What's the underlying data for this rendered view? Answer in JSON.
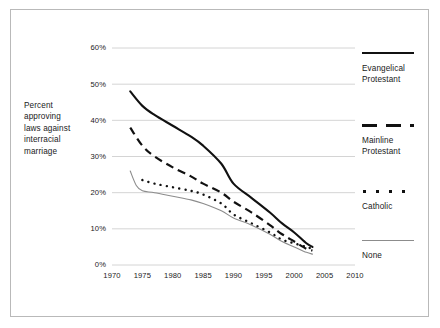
{
  "chart_data": {
    "type": "line",
    "title": "",
    "subtitle": "",
    "ylabel": "Percent approving laws against interracial marriage",
    "xlabel": "",
    "xlim": [
      1970,
      2010
    ],
    "ylim": [
      0,
      60
    ],
    "xticks": [
      "1970",
      "1975",
      "1980",
      "1985",
      "1990",
      "1995",
      "2000",
      "2005",
      "2010"
    ],
    "xtick_values": [
      1970,
      1975,
      1980,
      1985,
      1990,
      1995,
      2000,
      2005,
      2010
    ],
    "yticks": [
      "0%",
      "10%",
      "20%",
      "30%",
      "40%",
      "50%",
      "60%"
    ],
    "ytick_values": [
      0,
      10,
      20,
      30,
      40,
      50,
      60
    ],
    "grid": "horizontal",
    "legend_position": "right",
    "series": [
      {
        "name": "Evangelical Protestant",
        "style": "solid-thick",
        "color": "#111111",
        "x": [
          1973,
          1975,
          1977,
          1980,
          1983,
          1985,
          1988,
          1990,
          1993,
          1996,
          1998,
          2000,
          2002,
          2003
        ],
        "values": [
          48.0,
          44.0,
          41.5,
          38.5,
          35.5,
          33.0,
          28.0,
          22.5,
          18.5,
          14.5,
          11.5,
          9.0,
          6.0,
          5.0
        ]
      },
      {
        "name": "Mainline Protestant",
        "style": "dashed",
        "color": "#111111",
        "x": [
          1973,
          1975,
          1977,
          1980,
          1983,
          1985,
          1988,
          1990,
          1993,
          1996,
          1998,
          2000,
          2002,
          2003
        ],
        "values": [
          38.0,
          33.0,
          30.0,
          27.0,
          24.5,
          22.5,
          20.0,
          17.5,
          14.5,
          11.0,
          8.5,
          6.5,
          4.5,
          4.0
        ]
      },
      {
        "name": "Catholic",
        "style": "dotted",
        "color": "#111111",
        "x": [
          1975,
          1977,
          1980,
          1983,
          1985,
          1988,
          1990,
          1993,
          1996,
          1998,
          2000,
          2002,
          2003
        ],
        "values": [
          23.5,
          22.5,
          21.5,
          20.5,
          19.5,
          17.0,
          14.0,
          11.5,
          9.0,
          7.0,
          6.0,
          5.0,
          4.5
        ]
      },
      {
        "name": "None",
        "style": "solid-thin",
        "color": "#8c8c8c",
        "x": [
          1973,
          1974,
          1975,
          1977,
          1980,
          1983,
          1985,
          1988,
          1990,
          1993,
          1996,
          1998,
          2000,
          2002,
          2003
        ],
        "values": [
          26.0,
          22.0,
          20.5,
          20.0,
          19.0,
          18.0,
          17.0,
          15.0,
          13.0,
          11.0,
          8.5,
          6.5,
          5.0,
          3.5,
          3.0
        ]
      }
    ]
  },
  "legend": {
    "entries": [
      {
        "label_line1": "Evangelical",
        "label_line2": "Protestant"
      },
      {
        "label_line1": "Mainline",
        "label_line2": "Protestant"
      },
      {
        "label_line1": "Catholic",
        "label_line2": ""
      },
      {
        "label_line1": "None",
        "label_line2": ""
      }
    ]
  },
  "axis_caption": {
    "line1": "Percent",
    "line2": "approving",
    "line3": "laws against",
    "line4": "interracial",
    "line5": "marriage"
  }
}
